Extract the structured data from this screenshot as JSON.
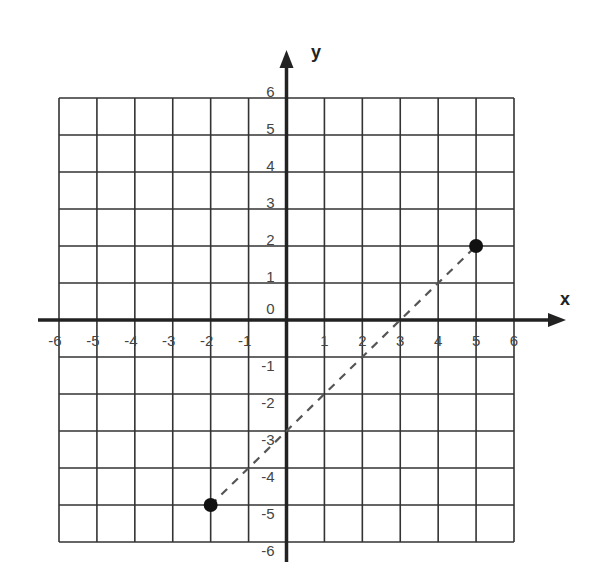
{
  "chart_data": {
    "type": "scatter",
    "title": "",
    "xlabel": "x",
    "ylabel": "y",
    "xlim": [
      -6,
      6
    ],
    "ylim": [
      -6,
      6
    ],
    "grid": true,
    "x_ticks": [
      "-6",
      "-5",
      "-4",
      "-3",
      "-2",
      "-1",
      "1",
      "2",
      "3",
      "4",
      "5",
      "6"
    ],
    "y_ticks": [
      "6",
      "5",
      "4",
      "3",
      "2",
      "1",
      "0",
      "-1",
      "-2",
      "-3",
      "-4",
      "-5",
      "-6"
    ],
    "points": [
      {
        "x": -2,
        "y": -5
      },
      {
        "x": 5,
        "y": 2
      }
    ],
    "line": {
      "style": "dashed",
      "from": {
        "x": -2,
        "y": -5
      },
      "to": {
        "x": 5,
        "y": 2
      },
      "x_intercept": 3,
      "y_intercept": -3
    }
  },
  "colors": {
    "grid": "#333333",
    "axis": "#222222",
    "point": "#111111",
    "line": "#555555",
    "text": "#444444"
  }
}
